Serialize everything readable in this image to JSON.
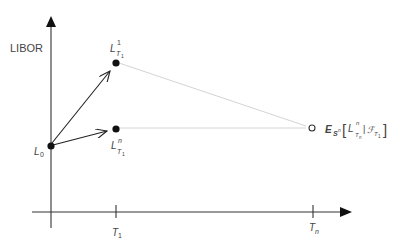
{
  "diagram": {
    "y_axis_label": "LIBOR",
    "x_ticks": [
      {
        "main": "T",
        "sub": "1"
      },
      {
        "main": "T",
        "sub": "n"
      }
    ],
    "points": {
      "start": {
        "main": "L",
        "sub": "0"
      },
      "upper": {
        "main": "L",
        "sup": "1",
        "sub": "T",
        "subsub": "1"
      },
      "lower": {
        "main": "L",
        "sup": "n",
        "sub": "T",
        "subsub": "1"
      },
      "expectation": {
        "operator": "E",
        "measure": "S",
        "measure_sup": "n",
        "open_bracket": "[",
        "inner_main": "L",
        "inner_sup": "n",
        "inner_sub": "T",
        "inner_subsub": "n",
        "given": "|",
        "filtration": "ℱ",
        "filtration_sub": "T",
        "filtration_subsub": "1",
        "close_bracket": "]"
      }
    },
    "colors": {
      "axis": "#333333",
      "dot": "#111111",
      "guide_line": "#d0d0d0",
      "text": "#444444"
    }
  }
}
